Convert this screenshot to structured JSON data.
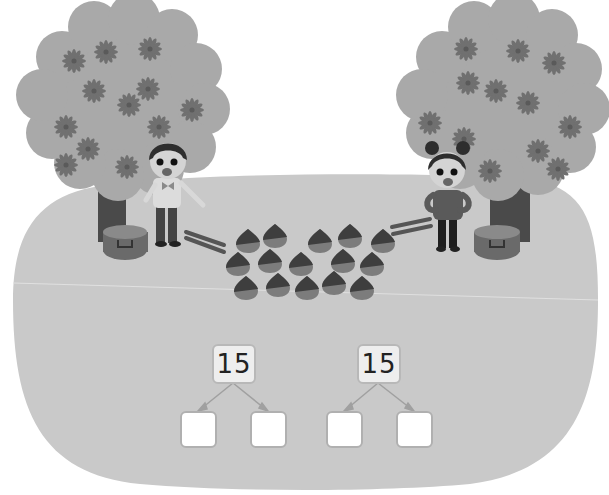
{
  "scene": {
    "description": "Two children collecting chestnuts under two trees",
    "colors": {
      "background": "#ffffff",
      "ground": "#c9c9c9",
      "ground_line": "#e2e2e2",
      "canopy": "#a9a9a9",
      "flower": "#6f6f6f",
      "trunk": "#4a4a4a",
      "chestnut_top": "#3d3d3d",
      "chestnut_bottom": "#7a7a7a",
      "box_border": "#b4b4b4",
      "arrow": "#a0a0a0"
    },
    "chestnut_count": 15,
    "chestnuts": [
      {
        "x": 248,
        "y": 241
      },
      {
        "x": 275,
        "y": 236
      },
      {
        "x": 320,
        "y": 241
      },
      {
        "x": 350,
        "y": 236
      },
      {
        "x": 383,
        "y": 241
      },
      {
        "x": 238,
        "y": 264
      },
      {
        "x": 270,
        "y": 261
      },
      {
        "x": 301,
        "y": 264
      },
      {
        "x": 343,
        "y": 261
      },
      {
        "x": 372,
        "y": 264
      },
      {
        "x": 246,
        "y": 288
      },
      {
        "x": 278,
        "y": 285
      },
      {
        "x": 307,
        "y": 288
      },
      {
        "x": 334,
        "y": 283
      },
      {
        "x": 362,
        "y": 288
      }
    ]
  },
  "problems": [
    {
      "total": "15",
      "parts": [
        "",
        ""
      ]
    },
    {
      "total": "15",
      "parts": [
        "",
        ""
      ]
    }
  ]
}
